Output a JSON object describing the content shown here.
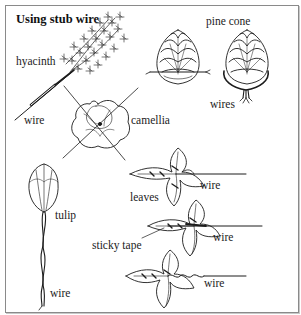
{
  "figure": {
    "title": "Using stub wire",
    "labels": {
      "hyacinth": "hyacinth",
      "hyacinth_wire": "wire",
      "pine_cone": "pine cone",
      "pine_cone_wires": "wires",
      "camellia": "camellia",
      "tulip": "tulip",
      "tulip_wire": "wire",
      "leaves": "leaves",
      "leaf1_wire": "wire",
      "sticky_tape": "sticky tape",
      "leaf2_wire": "wire",
      "leaf3_wire": "wire"
    },
    "colors": {
      "ink": "#1c1c1c",
      "frame": "#8a8a8a",
      "background": "#ffffff"
    }
  }
}
